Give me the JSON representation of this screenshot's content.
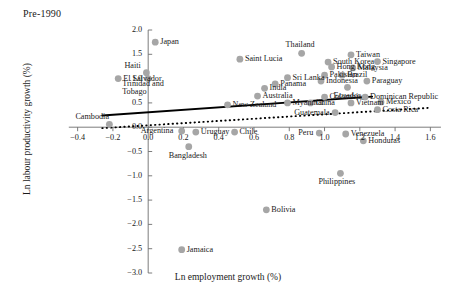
{
  "panel": {
    "title": "Pre-1990"
  },
  "axes": {
    "xlabel": "Ln employment growth (%)",
    "ylabel": "Ln labour productivity growth (%)",
    "xticks": [
      "-0.4",
      "-0.2",
      "0.0",
      "0.2",
      "0.4",
      "0.6",
      "0.8",
      "1.0",
      "1.2",
      "1.4",
      "1.6"
    ],
    "yticks": [
      "2.0",
      "1.5",
      "1.0",
      "0.5",
      "0.0",
      "-0.5",
      "-1.0",
      "-1.5",
      "-2.0",
      "-2.5",
      "-3.0"
    ]
  },
  "style": {
    "marker_color": "#a6a6a6",
    "axis_color": "#6e6e6e",
    "trend_solid_color": "#000000",
    "trend_dotted_color": "#000000"
  },
  "chart_data": {
    "type": "scatter",
    "title": "Pre-1990",
    "xlabel": "Ln employment growth (%)",
    "ylabel": "Ln labour productivity growth (%)",
    "xlim": [
      -0.5,
      1.7
    ],
    "ylim": [
      -3.0,
      2.0
    ],
    "grid": false,
    "legend": "none",
    "xticks": [
      -0.4,
      -0.2,
      0.0,
      0.2,
      0.4,
      0.6,
      0.8,
      1.0,
      1.2,
      1.4,
      1.6
    ],
    "yticks": [
      2.0,
      1.5,
      1.0,
      0.5,
      0.0,
      -0.5,
      -1.0,
      -1.5,
      -2.0,
      -2.5,
      -3.0
    ],
    "points": [
      {
        "label": "Japan",
        "x": 0.04,
        "y": 1.75,
        "label_pos": "right"
      },
      {
        "label": "Saint Lucia",
        "x": 0.52,
        "y": 1.4,
        "label_pos": "right"
      },
      {
        "label": "Haiti",
        "x": -0.01,
        "y": 1.12,
        "label_pos": "above-left"
      },
      {
        "label": "El Salvador",
        "x": -0.17,
        "y": 1.0,
        "label_pos": "right"
      },
      {
        "label": "Trinidad and Tobago",
        "x": 0.0,
        "y": 1.0,
        "label_pos": "below-right"
      },
      {
        "label": "Thailand",
        "x": 0.87,
        "y": 1.52,
        "label_pos": "above"
      },
      {
        "label": "Taiwan",
        "x": 1.15,
        "y": 1.49,
        "label_pos": "right"
      },
      {
        "label": "South Korea",
        "x": 1.02,
        "y": 1.34,
        "label_pos": "right"
      },
      {
        "label": "Singapore",
        "x": 1.3,
        "y": 1.35,
        "label_pos": "right"
      },
      {
        "label": "Hong Kong",
        "x": 1.04,
        "y": 1.24,
        "label_pos": "right"
      },
      {
        "label": "Malaysia",
        "x": 1.16,
        "y": 1.22,
        "label_pos": "right"
      },
      {
        "label": "Sri Lanka",
        "x": 0.79,
        "y": 1.02,
        "label_pos": "right"
      },
      {
        "label": "Pakistan",
        "x": 1.0,
        "y": 1.07,
        "label_pos": "right"
      },
      {
        "label": "Brazil",
        "x": 1.1,
        "y": 1.07,
        "label_pos": "right"
      },
      {
        "label": "Indonesia",
        "x": 0.98,
        "y": 0.95,
        "label_pos": "right"
      },
      {
        "label": "Paraguay",
        "x": 1.24,
        "y": 0.95,
        "label_pos": "right"
      },
      {
        "label": "Panama",
        "x": 0.72,
        "y": 0.89,
        "label_pos": "right"
      },
      {
        "label": "Ecuador",
        "x": 1.13,
        "y": 0.82,
        "label_pos": "below"
      },
      {
        "label": "India",
        "x": 0.66,
        "y": 0.8,
        "label_pos": "right"
      },
      {
        "label": "Australia",
        "x": 0.62,
        "y": 0.64,
        "label_pos": "right"
      },
      {
        "label": "Colombia",
        "x": 1.0,
        "y": 0.62,
        "label_pos": "right"
      },
      {
        "label": "Dominican Republic",
        "x": 1.23,
        "y": 0.62,
        "label_pos": "right"
      },
      {
        "label": "Mexico",
        "x": 1.32,
        "y": 0.52,
        "label_pos": "right"
      },
      {
        "label": "New Zealand",
        "x": 0.45,
        "y": 0.46,
        "label_pos": "right"
      },
      {
        "label": "Myanmar",
        "x": 0.79,
        "y": 0.5,
        "label_pos": "right"
      },
      {
        "label": "China",
        "x": 0.92,
        "y": 0.5,
        "label_pos": "right"
      },
      {
        "label": "Vietnam",
        "x": 1.15,
        "y": 0.5,
        "label_pos": "right"
      },
      {
        "label": "Costa Rica",
        "x": 1.3,
        "y": 0.36,
        "label_pos": "right"
      },
      {
        "label": "Guatemala",
        "x": 1.06,
        "y": 0.3,
        "label_pos": "left"
      },
      {
        "label": "Cambodia",
        "x": -0.22,
        "y": 0.06,
        "label_pos": "above-left"
      },
      {
        "label": "Argentina",
        "x": 0.19,
        "y": -0.08,
        "label_pos": "left"
      },
      {
        "label": "Uruguay",
        "x": 0.27,
        "y": -0.1,
        "label_pos": "right"
      },
      {
        "label": "Chile",
        "x": 0.49,
        "y": -0.1,
        "label_pos": "right"
      },
      {
        "label": "Peru",
        "x": 0.97,
        "y": -0.12,
        "label_pos": "left"
      },
      {
        "label": "Venezuela",
        "x": 1.12,
        "y": -0.14,
        "label_pos": "right"
      },
      {
        "label": "Bangladesh",
        "x": 0.23,
        "y": -0.4,
        "label_pos": "below"
      },
      {
        "label": "Honduras",
        "x": 1.22,
        "y": -0.28,
        "label_pos": "right"
      },
      {
        "label": "Philippines",
        "x": 1.09,
        "y": -0.95,
        "label_pos": "below"
      },
      {
        "label": "Bolivia",
        "x": 0.67,
        "y": -1.7,
        "label_pos": "right"
      },
      {
        "label": "Jamaica",
        "x": 0.19,
        "y": -2.52,
        "label_pos": "right"
      }
    ],
    "trendlines": [
      {
        "name": "solid-trend",
        "style": "solid",
        "x0": -0.26,
        "y0": 0.24,
        "x1": 1.27,
        "y1": 0.63
      },
      {
        "name": "dotted-trend",
        "style": "dotted",
        "x0": -0.26,
        "y0": -0.02,
        "x1": 1.6,
        "y1": 0.4
      }
    ]
  }
}
